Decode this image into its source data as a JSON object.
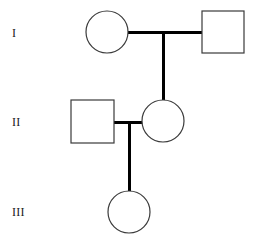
{
  "diagram": {
    "kind": "pedigree-chart",
    "width": 255,
    "height": 248,
    "background_color": "#ffffff",
    "symbol_stroke_color": "#3a3a3a",
    "symbol_fill_color": "#ffffff",
    "connector_color": "#000000",
    "symbol_stroke_width": 1.2,
    "connector_stroke_width": 3
  },
  "generation_labels": [
    {
      "id": "I",
      "text": "I",
      "x": 12,
      "y": 27
    },
    {
      "id": "II",
      "text": "II",
      "x": 12,
      "y": 116
    },
    {
      "id": "III",
      "text": "III",
      "x": 12,
      "y": 206
    }
  ],
  "individuals": [
    {
      "id": "I-1",
      "generation": "I",
      "sex": "female",
      "shape": "circle",
      "affected": false,
      "cx": 107,
      "cy": 32,
      "r": 21
    },
    {
      "id": "I-2",
      "generation": "I",
      "sex": "male",
      "shape": "square",
      "affected": false,
      "x": 202,
      "y": 11,
      "size": 42
    },
    {
      "id": "II-1",
      "generation": "II",
      "sex": "male",
      "shape": "square",
      "affected": false,
      "x": 71,
      "y": 100,
      "size": 43
    },
    {
      "id": "II-2",
      "generation": "II",
      "sex": "female",
      "shape": "circle",
      "affected": false,
      "cx": 163,
      "cy": 121,
      "r": 21
    },
    {
      "id": "III-1",
      "generation": "III",
      "sex": "female",
      "shape": "circle",
      "affected": false,
      "cx": 129,
      "cy": 212,
      "r": 21
    }
  ],
  "connectors": [
    {
      "id": "mating-line-I",
      "type": "mating-horizontal",
      "x1": 128,
      "y1": 32,
      "x2": 202,
      "y2": 32
    },
    {
      "id": "descent-line-I-to-II",
      "type": "descent-vertical",
      "x1": 163,
      "y1": 32,
      "x2": 163,
      "y2": 100
    },
    {
      "id": "mating-line-II",
      "type": "mating-horizontal",
      "x1": 114,
      "y1": 122,
      "x2": 143,
      "y2": 122
    },
    {
      "id": "descent-line-II-to-III",
      "type": "descent-vertical",
      "x1": 129,
      "y1": 122,
      "x2": 129,
      "y2": 191
    }
  ]
}
